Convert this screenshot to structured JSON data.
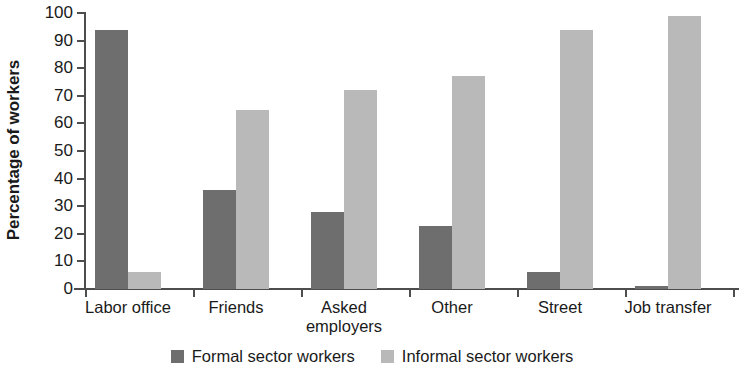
{
  "chart_data": {
    "type": "bar",
    "title": "",
    "subtitle": "",
    "xlabel": "",
    "ylabel": "Percentage of workers",
    "ylim": [
      0,
      100
    ],
    "yticks": [
      0,
      10,
      20,
      30,
      40,
      50,
      60,
      70,
      80,
      90,
      100
    ],
    "ytick_labels": [
      "0",
      "10",
      "20",
      "30",
      "40",
      "50",
      "60",
      "70",
      "80",
      "90",
      "100"
    ],
    "grid": false,
    "legend_position": "bottom-center",
    "categories": [
      "Labor office",
      "Friends",
      "Asked employers",
      "Other",
      "Street",
      "Job transfer"
    ],
    "category_label_lines": [
      [
        "Labor office"
      ],
      [
        "Friends"
      ],
      [
        "Asked",
        "employers"
      ],
      [
        "Other"
      ],
      [
        "Street"
      ],
      [
        "Job transfer"
      ]
    ],
    "series": [
      {
        "name": "Formal sector workers",
        "color": "#6e6e6e",
        "values": [
          94,
          36,
          28,
          23,
          6,
          1
        ]
      },
      {
        "name": "Informal sector workers",
        "color": "#b9b9b9",
        "values": [
          6,
          65,
          72,
          77,
          94,
          99
        ]
      }
    ],
    "annotations": []
  },
  "legend": {
    "items": [
      {
        "label": "Formal sector workers",
        "swatch": "formal"
      },
      {
        "label": "Informal sector workers",
        "swatch": "informal"
      }
    ]
  },
  "colors": {
    "formal": "#6e6e6e",
    "informal": "#b9b9b9",
    "axis": "#4d4d4d",
    "text": "#1a1a1a",
    "background": "#ffffff"
  }
}
